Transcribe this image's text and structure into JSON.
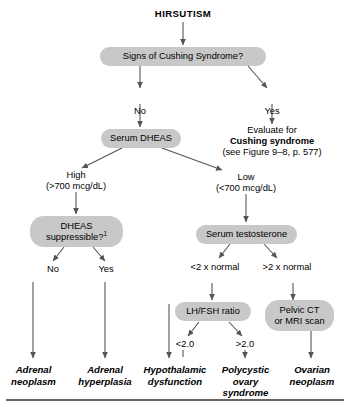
{
  "figure": {
    "title": "HIRSUTISM"
  },
  "nodes": {
    "cushing_signs": "Signs of Cushing Syndrome?",
    "serum_dheas": "Serum DHEAS",
    "dheas_suppressible_line1": "DHEAS",
    "dheas_suppressible_line2": "suppressible?",
    "dheas_suppressible_footnote": "1",
    "serum_testosterone": "Serum testosterone",
    "lh_fsh_ratio": "LH/FSH ratio",
    "pelvic_ct_line1": "Pelvic CT",
    "pelvic_ct_line2": "or MRI scan"
  },
  "edge_labels": {
    "no_cushing": "No",
    "yes_cushing": "Yes",
    "dheas_high": "High",
    "dheas_high_value": "(>700 mcg/dL)",
    "dheas_low": "Low",
    "dheas_low_value": "(<700 mcg/dL)",
    "suppress_no": "No",
    "suppress_yes": "Yes",
    "testosterone_low": "<2 x normal",
    "testosterone_high": ">2 x normal",
    "lhfsh_low": "<2.0",
    "lhfsh_high": ">2.0"
  },
  "evaluate_block": {
    "line1": "Evaluate for",
    "line2": "Cushing syndrome",
    "line3": "(see Figure 9–8, p. 577)"
  },
  "terminals": [
    {
      "line1": "Adrenal",
      "line2": "neoplasm"
    },
    {
      "line1": "Adrenal",
      "line2": "hyperplasia"
    },
    {
      "line1": "Hypothalamic",
      "line2": "dysfunction"
    },
    {
      "line1": "Polycystic",
      "line2": "ovary",
      "line3": "syndrome"
    },
    {
      "line1": "Ovarian",
      "line2": "neoplasm"
    }
  ],
  "colors": {
    "node_fill": "#c8c8c8",
    "connector": "#555555",
    "text": "#000000",
    "rule": "#333333"
  }
}
